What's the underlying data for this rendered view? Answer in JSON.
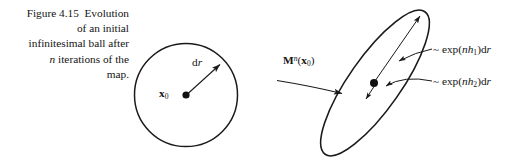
{
  "figure": {
    "caption_lines": [
      "Figure 4.15  Evolution",
      "of an initial",
      "infinitesimal ball after",
      "n iterations of the",
      "map."
    ],
    "caption_line_1": "Figure 4.15  Evolution",
    "caption_line_2": "of an initial",
    "caption_line_3": "infinitesimal ball after",
    "caption_line_4_italic": "n",
    "caption_line_4_rest": " iterations of the",
    "caption_line_5": "map.",
    "background_color": "#ffffff",
    "ink_color": "#1a1a1a"
  },
  "ball": {
    "center_label_bold": "x",
    "center_label_sub": "0",
    "radius_label_d": "d",
    "radius_label_r": "r",
    "shape": "circle"
  },
  "map_arrow": {
    "label_bold_m": "M",
    "label_exponent": "n",
    "label_paren_open": "(",
    "label_bold_x": "x",
    "label_sub": "0",
    "label_paren_close": ")"
  },
  "ellipse": {
    "shape": "ellipse",
    "tilt_degrees": -55,
    "expanding_axis": {
      "tilde": "~ ",
      "exp": "exp(",
      "n": "n",
      "h": "h",
      "sub": "1",
      "close": ")d",
      "r": "r"
    },
    "contracting_axis": {
      "tilde": "~ ",
      "exp": "exp(",
      "n": "n",
      "h": "h",
      "sub": "2",
      "close": ")d",
      "r": "r"
    }
  }
}
